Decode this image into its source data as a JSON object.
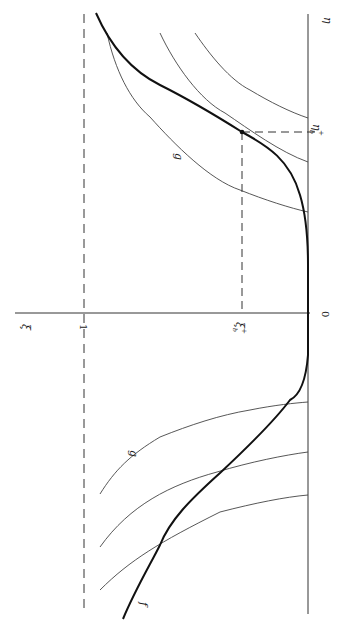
{
  "figure": {
    "orientation": "rotated 90deg clockwise",
    "colors": {
      "axis": "#333333",
      "curve_f": "#111111",
      "curve_g": "#444444",
      "dashed": "#333333"
    },
    "labels": {
      "eta_axis": "η",
      "xi_axis": "ξ",
      "one": "1",
      "zero": "0",
      "xi_b_plus": "ξ",
      "xi_b_plus_sub": "b",
      "xi_b_plus_sup": "+",
      "eta_b_plus": "η",
      "eta_b_plus_sub": "b",
      "eta_b_plus_sup": "+",
      "g_upper": "g",
      "g_lower": "g",
      "f": "f"
    },
    "axes": {
      "eta_axis": {
        "x1": 308,
        "y1": 14,
        "x2": 308,
        "y2": 614
      },
      "xi_axis": {
        "x1": 15,
        "y1": 313,
        "x2": 310,
        "y2": 313
      },
      "xi_equals_one_dashed": {
        "x1": 84,
        "y1": 14,
        "x2": 84,
        "y2": 614
      }
    },
    "point_b": {
      "x": 242,
      "y": 132
    },
    "paths": {
      "f": "M96,13 C110,45 130,70 160,85 C190,100 215,115 242,132 C268,146 290,160 300,195 C306,215 308,240 308,265 L308,355 C306,380 300,395 290,400 C275,420 250,445 220,473 C190,500 170,520 160,545 C150,565 135,590 123,619",
      "g_upper_1": "M107,33 C115,70 130,100 150,117 C175,145 210,180 240,190 C265,200 290,208 308,212",
      "g_upper_2": "M160,33 C175,65 200,100 225,113 C250,130 280,152 308,162",
      "g_upper_3": "M195,33 C210,55 230,80 250,90 C270,102 290,112 308,118",
      "g_lower_1": "M100,494 C115,470 130,455 160,437 C190,425 220,415 250,410 C275,405 295,403 308,402",
      "g_lower_2": "M100,547 C130,505 170,485 217,472 C250,462 285,455 308,452",
      "g_lower_3": "M100,590 C130,560 160,542 220,512 C255,503 285,497 308,495"
    }
  }
}
